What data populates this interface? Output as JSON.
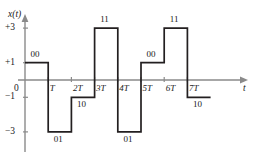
{
  "figure": {
    "kind": "waveform-plot",
    "y_axis_name": "x(t)",
    "x_axis_name": "t",
    "line_color": "#231f20",
    "axis_color": "#8a8a8a",
    "background": "#ffffff"
  },
  "y_ticks": [
    {
      "label": "+3",
      "value": 3
    },
    {
      "label": "+1",
      "value": 1
    },
    {
      "label": "−1",
      "value": -1
    },
    {
      "label": "−3",
      "value": -3
    }
  ],
  "origin_label": "0",
  "x_ticks": [
    {
      "label": "T",
      "value": 1
    },
    {
      "label": "2T",
      "value": 2
    },
    {
      "label": "3T",
      "value": 3
    },
    {
      "label": "4T",
      "value": 4
    },
    {
      "label": "5T",
      "value": 5
    },
    {
      "label": "6T",
      "value": 6
    },
    {
      "label": "7T",
      "value": 7
    }
  ],
  "dibit_labels": [
    {
      "text": "00",
      "symbol_index": 0,
      "placement": "above"
    },
    {
      "text": "01",
      "symbol_index": 1,
      "placement": "below"
    },
    {
      "text": "10",
      "symbol_index": 2,
      "placement": "below"
    },
    {
      "text": "11",
      "symbol_index": 3,
      "placement": "above"
    },
    {
      "text": "01",
      "symbol_index": 4,
      "placement": "below"
    },
    {
      "text": "00",
      "symbol_index": 5,
      "placement": "above"
    },
    {
      "text": "11",
      "symbol_index": 6,
      "placement": "above"
    },
    {
      "text": "10",
      "symbol_index": 7,
      "placement": "below"
    }
  ],
  "chart_data": {
    "type": "line",
    "title": "",
    "xlabel": "t",
    "ylabel": "x(t)",
    "xlim": [
      0,
      8
    ],
    "ylim": [
      -4,
      4
    ],
    "grid": false,
    "legend": "none",
    "step_style": "post",
    "x": [
      0,
      1,
      2,
      3,
      4,
      5,
      6,
      7,
      8
    ],
    "symbol_intervals": [
      {
        "start": 0,
        "end": 1,
        "level": 1,
        "dibit": "00"
      },
      {
        "start": 1,
        "end": 2,
        "level": -3,
        "dibit": "01"
      },
      {
        "start": 2,
        "end": 3,
        "level": -1,
        "dibit": "10"
      },
      {
        "start": 3,
        "end": 4,
        "level": 3,
        "dibit": "11"
      },
      {
        "start": 4,
        "end": 5,
        "level": -3,
        "dibit": "01"
      },
      {
        "start": 5,
        "end": 6,
        "level": 1,
        "dibit": "00"
      },
      {
        "start": 6,
        "end": 7,
        "level": 3,
        "dibit": "11"
      },
      {
        "start": 7,
        "end": 8,
        "level": -1,
        "dibit": "10"
      }
    ],
    "values": [
      1,
      -3,
      -1,
      3,
      -3,
      1,
      3,
      -1
    ],
    "categories": [
      "00",
      "01",
      "10",
      "11",
      "01",
      "00",
      "11",
      "10"
    ],
    "xtick_labels": [
      "0",
      "T",
      "2T",
      "3T",
      "4T",
      "5T",
      "6T",
      "7T"
    ],
    "ytick_labels": [
      "+3",
      "+1",
      "−1",
      "−3"
    ],
    "ytick_values": [
      3,
      1,
      -1,
      -3
    ]
  }
}
